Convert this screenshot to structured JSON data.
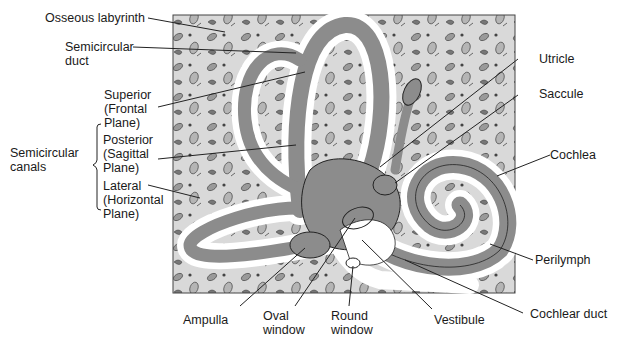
{
  "diagram": {
    "colors": {
      "bone": "#d9d9d9",
      "membrane": "#8c8c8c",
      "perilymph": "#ffffff",
      "outline": "#222222",
      "leader": "#222222"
    },
    "labels": {
      "osseous_labyrinth": "Osseous labyrinth",
      "semicircular_duct": [
        "Semicircular",
        "duct"
      ],
      "semicircular_canals": [
        "Semicircular",
        "canals"
      ],
      "superior": [
        "Superior",
        "(Frontal",
        "Plane)"
      ],
      "posterior": [
        "Posterior",
        "(Sagittal",
        "Plane)"
      ],
      "lateral": [
        "Lateral",
        "(Horizontal",
        "Plane)"
      ],
      "utricle": "Utricle",
      "saccule": "Saccule",
      "cochlea": "Cochlea",
      "perilymph": "Perilymph",
      "cochlear_duct": "Cochlear duct",
      "vestibule": "Vestibule",
      "round_window": [
        "Round",
        "window"
      ],
      "oval_window": [
        "Oval",
        "window"
      ],
      "ampulla": "Ampulla"
    }
  }
}
